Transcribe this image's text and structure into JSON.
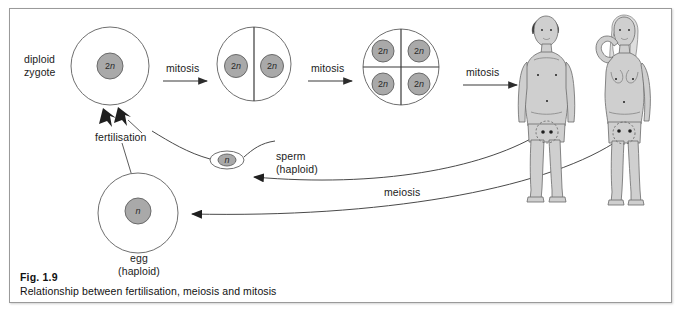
{
  "figure": {
    "caption_id": "Fig. 1.9",
    "caption_text": "Relationship between fertilisation, meiosis and mitosis"
  },
  "labels": {
    "diploid_zygote": "diploid\nzygote",
    "fertilisation": "fertilisation",
    "mitosis_1": "mitosis",
    "mitosis_2": "mitosis",
    "mitosis_3": "mitosis",
    "meiosis": "meiosis",
    "sperm": "sperm\n(haploid)",
    "egg": "egg\n(haploid)"
  },
  "cells": {
    "zygote": {
      "nucleus_label": "2n",
      "count": 1
    },
    "two_cell": {
      "nucleus_label": "2n",
      "count": 2
    },
    "four_cell": {
      "nucleus_label": "2n",
      "count": 4
    },
    "sperm": {
      "nucleus_label": "n"
    },
    "egg": {
      "nucleus_label": "n"
    }
  },
  "organisms": {
    "male": "adult-male-figure",
    "female": "adult-female-figure"
  },
  "colors": {
    "nucleus_fill": "#a9a9a9",
    "cell_stroke": "#6f6f6f",
    "body_fill": "#cfcfcf",
    "arrow_stroke": "#3a3a3a",
    "frame_border": "#9a9a9a",
    "text": "#1b1b1b"
  }
}
